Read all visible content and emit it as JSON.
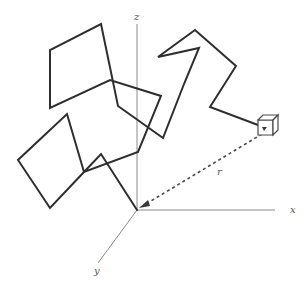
{
  "figure": {
    "axes": {
      "x_label": "x",
      "y_label": "y",
      "z_label": "z",
      "origin": [
        137,
        210
      ],
      "x_end": [
        275,
        210
      ],
      "y_end": [
        98,
        263
      ],
      "z_end": [
        137,
        24
      ]
    },
    "vector_label": "r",
    "colors": {
      "chain": "#2e2e2e",
      "axis": "#8a8a8a",
      "vector": "#4a4a4a",
      "background": "#ffffff"
    },
    "chain_points": [
      [
        137,
        210
      ],
      [
        101,
        154
      ],
      [
        84,
        172
      ],
      [
        50,
        208
      ],
      [
        18,
        160
      ],
      [
        67,
        114
      ],
      [
        84,
        172
      ],
      [
        138,
        152
      ],
      [
        161,
        96
      ],
      [
        110,
        80
      ],
      [
        50,
        108
      ],
      [
        50,
        50
      ],
      [
        101,
        24
      ],
      [
        118,
        106
      ],
      [
        163,
        138
      ],
      [
        184,
        84
      ],
      [
        199,
        48
      ],
      [
        158,
        57
      ],
      [
        195,
        30
      ],
      [
        236,
        66
      ],
      [
        210,
        107
      ],
      [
        266,
        128
      ]
    ],
    "end_marker": "cube",
    "end_point": [
      266,
      128
    ]
  }
}
